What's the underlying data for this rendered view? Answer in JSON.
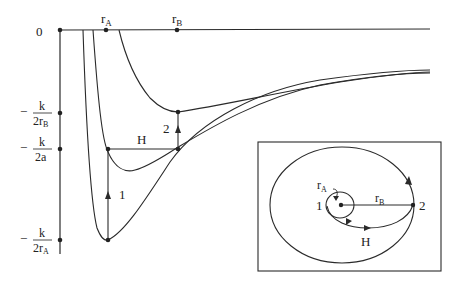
{
  "diagram": {
    "type": "effective-potential-hohmann-transfer",
    "axis": {
      "zero_label": "0",
      "tick_labels": [
        {
          "id": "rA",
          "main": "r",
          "sub": "A"
        },
        {
          "id": "rB",
          "main": "r",
          "sub": "B"
        }
      ],
      "energy_levels": [
        {
          "id": "k_2rB",
          "sign": "−",
          "num": "k",
          "den_main": "2r",
          "den_sub": "B"
        },
        {
          "id": "k_2a",
          "sign": "−",
          "num": "k",
          "den_main": "2a",
          "den_sub": ""
        },
        {
          "id": "k_2rA",
          "sign": "−",
          "num": "k",
          "den_main": "2r",
          "den_sub": "A"
        }
      ]
    },
    "transitions": {
      "step1_label": "1",
      "step2_label": "2",
      "transfer_label": "H"
    },
    "inset": {
      "point1_label": "1",
      "point2_label": "2",
      "rA_main": "r",
      "rA_sub": "A",
      "rB_main": "r",
      "rB_sub": "B",
      "transfer_label": "H"
    },
    "colors": {
      "stroke": "#2a2a2a",
      "background": "#ffffff"
    }
  }
}
